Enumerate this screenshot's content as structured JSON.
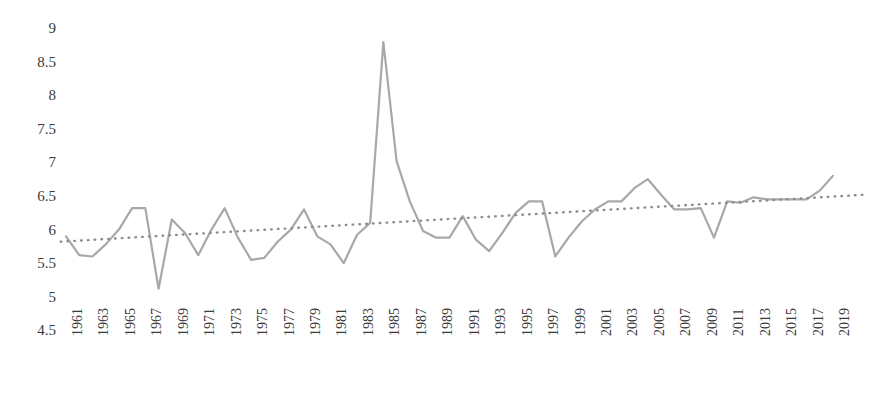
{
  "chart_data": {
    "type": "line",
    "title": "",
    "subtitle": "",
    "xlabel": "",
    "ylabel": "",
    "grid": false,
    "legend": "none",
    "ylim": [
      4.5,
      9.0
    ],
    "ytick_step": 0.5,
    "ytick_labels": [
      "9",
      "8.5",
      "8",
      "7.5",
      "7",
      "6.5",
      "6",
      "5.5",
      "5",
      "4.5"
    ],
    "ytick_values": [
      9,
      8.5,
      8,
      7.5,
      7,
      6.5,
      6,
      5.5,
      5,
      4.5
    ],
    "xlim": [
      1961,
      2020
    ],
    "xtick_labels": [
      "1961",
      "1963",
      "1965",
      "1967",
      "1969",
      "1971",
      "1973",
      "1975",
      "1977",
      "1979",
      "1981",
      "1983",
      "1985",
      "1987",
      "1989",
      "1991",
      "1993",
      "1995",
      "1997",
      "1999",
      "2001",
      "2003",
      "2005",
      "2007",
      "2009",
      "2011",
      "2013",
      "2015",
      "2017",
      "2019"
    ],
    "xtick_values": [
      1961,
      1963,
      1965,
      1967,
      1969,
      1971,
      1973,
      1975,
      1977,
      1979,
      1981,
      1983,
      1985,
      1987,
      1989,
      1991,
      1993,
      1995,
      1997,
      1999,
      2001,
      2003,
      2005,
      2007,
      2009,
      2011,
      2013,
      2015,
      2017,
      2019
    ],
    "x": [
      1961,
      1962,
      1963,
      1964,
      1965,
      1966,
      1967,
      1968,
      1969,
      1970,
      1971,
      1972,
      1973,
      1974,
      1975,
      1976,
      1977,
      1978,
      1979,
      1980,
      1981,
      1982,
      1983,
      1984,
      1985,
      1986,
      1987,
      1988,
      1989,
      1990,
      1991,
      1992,
      1993,
      1994,
      1995,
      1996,
      1997,
      1998,
      1999,
      2000,
      2001,
      2002,
      2003,
      2004,
      2005,
      2006,
      2007,
      2008,
      2009,
      2010,
      2011,
      2012,
      2013,
      2014,
      2015,
      2016,
      2017,
      2018,
      2019
    ],
    "series": [
      {
        "name": "value",
        "style": "solid",
        "color": "#a8a8a8",
        "values": [
          5.9,
          5.62,
          5.6,
          5.78,
          6.0,
          6.32,
          6.32,
          5.12,
          6.15,
          5.95,
          5.62,
          6.0,
          6.32,
          5.88,
          5.55,
          5.58,
          5.82,
          6.0,
          6.3,
          5.9,
          5.78,
          5.5,
          5.92,
          6.1,
          8.79,
          7.02,
          6.42,
          5.98,
          5.88,
          5.88,
          6.2,
          5.85,
          5.68,
          5.95,
          6.25,
          6.42,
          6.42,
          5.6,
          5.88,
          6.12,
          6.3,
          6.42,
          6.42,
          6.62,
          6.75,
          6.52,
          6.3,
          6.3,
          6.32,
          5.88,
          6.42,
          6.4,
          6.48,
          6.45,
          6.45,
          6.45,
          6.45,
          6.58,
          6.8
        ]
      },
      {
        "name": "trendline",
        "style": "dotted",
        "color": "#8c8c8c",
        "x_start": 1960.6,
        "x_end": 2021.5,
        "y_start": 5.82,
        "y_end": 6.52
      }
    ]
  },
  "axis": {
    "y_label_color": "#3a3a3a",
    "x_label_color": "#3a3a3a"
  },
  "colors": {
    "background": "#ffffff",
    "line": "#a8a8a8",
    "trend": "#8c8c8c"
  }
}
